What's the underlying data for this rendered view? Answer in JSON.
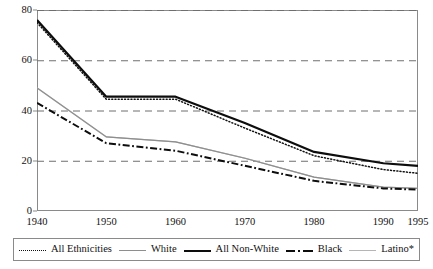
{
  "chart_data": {
    "type": "line",
    "title": "",
    "subtitle": "",
    "xlabel": "",
    "ylabel": "",
    "xlim": [
      1940,
      1995
    ],
    "ylim": [
      0,
      80
    ],
    "grid": "horizontal-dashed",
    "legend_position": "bottom",
    "x": [
      1940,
      1950,
      1960,
      1970,
      1980,
      1990,
      1995
    ],
    "xticklabels": [
      "1940",
      "1950",
      "1960",
      "1970",
      "1980",
      "1990",
      "1995"
    ],
    "yticklabels": [
      "0",
      "20",
      "40",
      "60",
      "80"
    ],
    "yticks": [
      0,
      20,
      40,
      60,
      80
    ],
    "series": [
      {
        "name": "All Ethnicities",
        "style": "dotted",
        "color": "#111111",
        "values": [
          75,
          44.5,
          44.5,
          33,
          22,
          16.5,
          15
        ]
      },
      {
        "name": "White",
        "style": "thin-solid",
        "color": "#8e8e8e",
        "values": [
          49,
          29.5,
          27.5,
          21,
          13.5,
          9.5,
          9
        ]
      },
      {
        "name": "All Non-White",
        "style": "thick-solid",
        "color": "#0d0d0d",
        "values": [
          76,
          45.5,
          45.5,
          35,
          23.5,
          19,
          18
        ]
      },
      {
        "name": "Black",
        "style": "dash-dot",
        "color": "#0d0d0d",
        "values": [
          43,
          27,
          24,
          18,
          12,
          9,
          8.5
        ]
      },
      {
        "name": "Latino*",
        "style": "light-solid",
        "color": "#b5b5b5",
        "values": [
          49,
          29.5,
          27.5,
          21,
          13.5,
          9.5,
          9
        ]
      }
    ]
  },
  "legend": {
    "items": [
      {
        "label": "All Ethnicities"
      },
      {
        "label": "White"
      },
      {
        "label": "All Non-White"
      },
      {
        "label": "Black"
      },
      {
        "label": "Latino*"
      }
    ]
  }
}
